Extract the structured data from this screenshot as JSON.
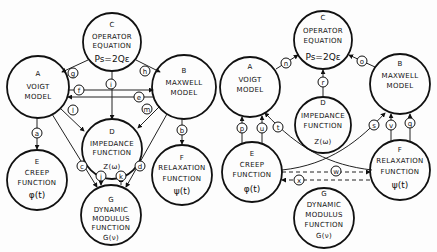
{
  "left": {
    "nodes": {
      "A": {
        "letter": "A",
        "l1": "VOIGT",
        "l2": "MODEL"
      },
      "B": {
        "letter": "B",
        "l1": "MAXWELL",
        "l2": "MODEL"
      },
      "C": {
        "letter": "C",
        "l1": "OPERATOR",
        "l2": "EQUATION",
        "f": "Ps=2Qε"
      },
      "D": {
        "letter": "D",
        "l1": "IMPEDANCE",
        "l2": "FUNCTION",
        "f": "Z(ω)"
      },
      "E": {
        "letter": "E",
        "l1": "CREEP",
        "l2": "FUNCTION",
        "f": "φ(t)"
      },
      "F": {
        "letter": "F",
        "l1": "RELAXATION",
        "l2": "FUNCTION",
        "f": "ψ(t)"
      },
      "G": {
        "letter": "G",
        "l1": "DYNAMIC",
        "l2": "MODULUS",
        "l3": "FUNCTION",
        "f": "G(ν)"
      }
    },
    "edges": {
      "a": "a",
      "b": "b",
      "c": "c",
      "d": "d",
      "e": "e",
      "f": "f",
      "g": "g",
      "h": "h",
      "i": "i",
      "j": "j",
      "k": "k",
      "l": "l",
      "m": "m"
    }
  },
  "right": {
    "nodes": {
      "A": {
        "letter": "A",
        "l1": "VOIGT",
        "l2": "MODEL"
      },
      "B": {
        "letter": "B",
        "l1": "MAXWELL",
        "l2": "MODEL"
      },
      "C": {
        "letter": "C",
        "l1": "OPERATOR",
        "l2": "EQUATION",
        "f": "Ps=2Qε"
      },
      "D": {
        "letter": "D",
        "l1": "IMPEDANCE",
        "l2": "FUNCTION",
        "f": "Z(ω)"
      },
      "E": {
        "letter": "E",
        "l1": "CREEP",
        "l2": "FUNCTION",
        "f": "φ(t)"
      },
      "F": {
        "letter": "F",
        "l1": "RELAXATION",
        "l2": "FUNCTION",
        "f": "ψ(t)"
      },
      "G": {
        "letter": "G",
        "l1": "DYNAMIC",
        "l2": "MODULUS",
        "l3": "FUNCTION",
        "f": "G(ν)"
      }
    },
    "edges": {
      "n": "n",
      "o": "o",
      "p": "p",
      "q": "q",
      "r": "r",
      "s": "s",
      "t": "t",
      "u": "u",
      "v": "v",
      "w": "w",
      "x": "x"
    }
  }
}
